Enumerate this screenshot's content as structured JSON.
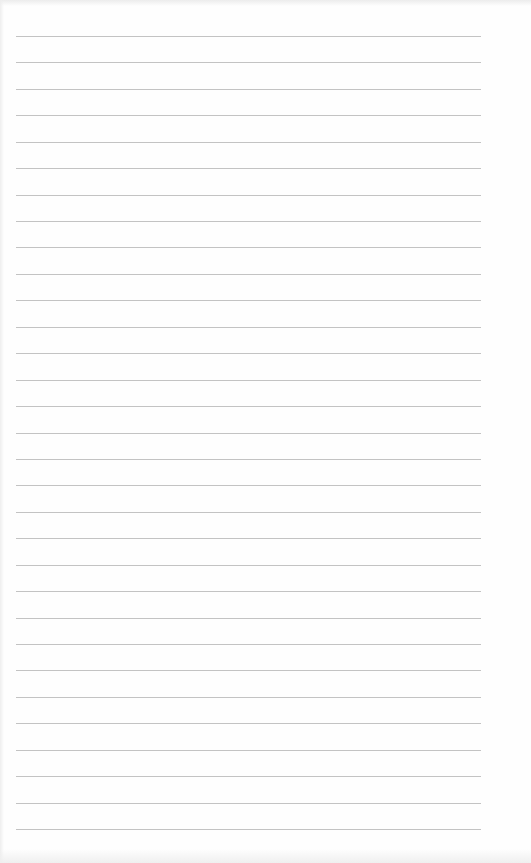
{
  "document": {
    "type": "blank-lined-paper",
    "background_color": "#fefefe",
    "rule_color": "#b8b8b8",
    "rule_count": 31,
    "rule_left_px": 16,
    "rule_width_px": 465,
    "first_rule_y_px": 36,
    "last_rule_y_px": 829,
    "rule_spacing_px": 26.43,
    "text_content": []
  }
}
